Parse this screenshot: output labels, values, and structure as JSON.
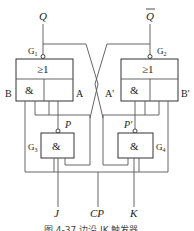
{
  "diagram": {
    "type": "logic-circuit",
    "outputs": {
      "q": "Q",
      "q_bar": "Q"
    },
    "gates": [
      {
        "id": "G1",
        "label": "G",
        "sub": "1",
        "or_symbol": "≥1",
        "and_symbol": "&",
        "left_input": "B",
        "right_input": "A"
      },
      {
        "id": "G2",
        "label": "G",
        "sub": "2",
        "or_symbol": "≥1",
        "and_symbol": "&",
        "left_input": "A'",
        "right_input": "B'"
      },
      {
        "id": "G3",
        "label": "G",
        "sub": "3",
        "and_symbol": "&",
        "output": "P"
      },
      {
        "id": "G4",
        "label": "G",
        "sub": "4",
        "and_symbol": "&",
        "output": "P'"
      }
    ],
    "inputs": {
      "j": "J",
      "cp": "CP",
      "k": "K"
    },
    "caption": "图 4-37   边沿 JK 触发器"
  }
}
